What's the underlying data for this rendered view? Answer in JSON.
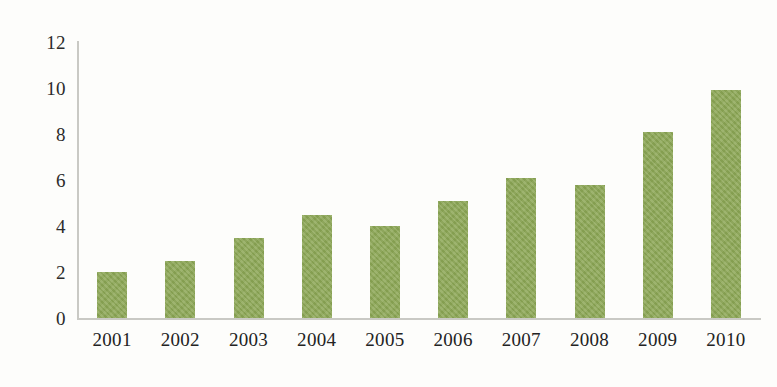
{
  "chart_data": {
    "type": "bar",
    "title": "",
    "subtitle": "",
    "xlabel": "",
    "ylabel": "",
    "categories": [
      "2001",
      "2002",
      "2003",
      "2004",
      "2005",
      "2006",
      "2007",
      "2008",
      "2009",
      "2010"
    ],
    "values": [
      2.0,
      2.5,
      3.5,
      4.5,
      4.0,
      5.1,
      6.1,
      5.8,
      8.1,
      9.9
    ],
    "ylim": [
      0,
      12
    ],
    "ytick_labels": [
      "0",
      "2",
      "4",
      "6",
      "8",
      "10",
      "12"
    ],
    "ytick_values": [
      0,
      2,
      4,
      6,
      8,
      10,
      12
    ],
    "grid": false,
    "legend": null,
    "legend_position": "none",
    "annotations": [],
    "series": [
      {
        "name": "",
        "values": [
          2.0,
          2.5,
          3.5,
          4.5,
          4.0,
          5.1,
          6.1,
          5.8,
          8.1,
          9.9
        ]
      }
    ]
  },
  "style": {
    "bar_color": "#8ca755",
    "axis_color": "#c9c9c4",
    "text_color": "#232323",
    "background": "#fdfdfb"
  }
}
